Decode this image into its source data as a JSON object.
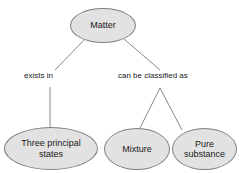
{
  "diagram": {
    "background_color": "#ffffff",
    "node_fill_color": "#e2e2e2",
    "node_border_color": "#808080",
    "edge_color": "#8a8a8a",
    "text_color": "#1a1a1a",
    "nodes": [
      {
        "id": "matter",
        "label": "Matter"
      },
      {
        "id": "three_principal_states",
        "label": "Three principal\nstates"
      },
      {
        "id": "mixture",
        "label": "Mixture"
      },
      {
        "id": "pure_substance",
        "label": "Pure\nsubstance"
      }
    ],
    "edge_labels": [
      {
        "id": "exists_in",
        "label": "exists in"
      },
      {
        "id": "can_be_classified_as",
        "label": "can be classified as"
      }
    ]
  }
}
